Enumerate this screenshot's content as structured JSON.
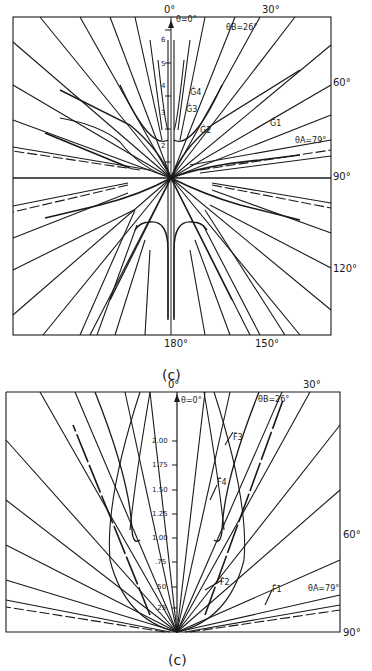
{
  "figures": [
    {
      "id": "top",
      "caption": "(c)",
      "angle_labels": {
        "a0": "0°",
        "a30": "30°",
        "a60": "60°",
        "a90": "90°",
        "a120": "120°",
        "a150": "150°",
        "a180": "180°"
      },
      "annotations": {
        "theta0": "θ=0°",
        "thetaB": "θB=26°",
        "thetaA": "θA=79°"
      },
      "curve_labels": {
        "g1": "Ĝ1",
        "g2": "Ĝ2",
        "g3": "Ĝ3",
        "g4": "Ĝ4"
      },
      "y_ticks": [
        "2",
        "3",
        "4",
        "5",
        "6"
      ]
    },
    {
      "id": "bottom",
      "caption": "(c)",
      "angle_labels": {
        "a0": "0°",
        "a30": "30°",
        "a60": "60°",
        "a90": "90°"
      },
      "annotations": {
        "theta0": "θ=0°",
        "thetaB": "θB=26°",
        "thetaA": "θA=79°"
      },
      "curve_labels": {
        "f1": "F̂1",
        "f2": "F̂2",
        "f3": "F̂3",
        "f4": "F̂4"
      },
      "y_ticks": [
        ".25",
        ".50",
        ".75",
        "1.00",
        "1.25",
        "1.50",
        "1.75",
        "2.00"
      ]
    }
  ]
}
